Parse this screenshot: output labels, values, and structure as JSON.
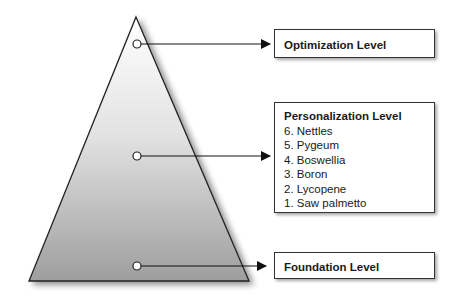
{
  "diagram": {
    "type": "pyramid",
    "levels": [
      {
        "id": "optimization",
        "title": "Optimization Level",
        "items": []
      },
      {
        "id": "personalization",
        "title": "Personalization Level",
        "items": [
          "6. Nettles",
          "5. Pygeum",
          "4. Boswellia",
          "3. Boron",
          "2. Lycopene",
          "1. Saw palmetto"
        ]
      },
      {
        "id": "foundation",
        "title": "Foundation Level",
        "items": []
      }
    ],
    "colors": {
      "gradient_top": "#ffffff",
      "gradient_bottom": "#9a9a9a",
      "stroke": "#222222"
    }
  }
}
